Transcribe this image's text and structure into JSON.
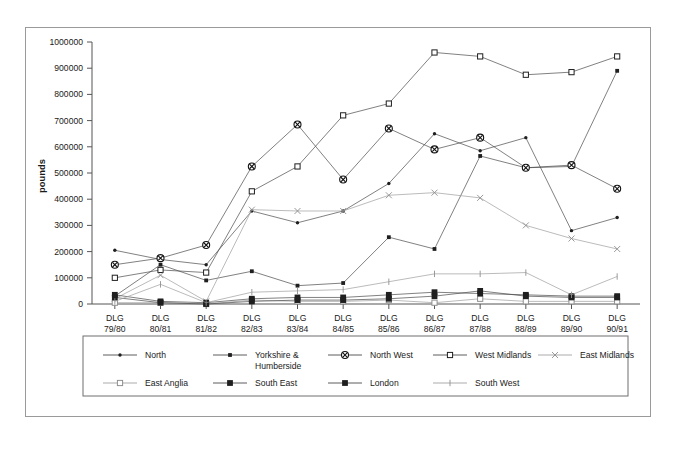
{
  "figure": {
    "y_axis_title": "pounds",
    "frame_color": "#9a9a9a",
    "ink_color": "#333333"
  },
  "chart_data": {
    "type": "line",
    "title": "",
    "subtitle": "",
    "xlabel": "",
    "ylabel": "pounds",
    "ylim": [
      0,
      1000000
    ],
    "ytick_step": 100000,
    "ytick_labels": [
      "0",
      "100000",
      "200000",
      "300000",
      "400000",
      "500000",
      "600000",
      "700000",
      "800000",
      "900000",
      "1000000"
    ],
    "grid": false,
    "legend_position": "bottom",
    "categories": [
      "DLG 79/80",
      "DLG 80/81",
      "DLG 81/82",
      "DLG 82/83",
      "DLG 83/84",
      "DLG 84/85",
      "DLG 85/86",
      "DLG 86/87",
      "DLG 87/88",
      "DLG 88/89",
      "DLG 89/90",
      "DLG 90/91"
    ],
    "category_lines": [
      [
        "DLG",
        "79/80"
      ],
      [
        "DLG",
        "80/81"
      ],
      [
        "DLG",
        "81/82"
      ],
      [
        "DLG",
        "82/83"
      ],
      [
        "DLG",
        "83/84"
      ],
      [
        "DLG",
        "84/85"
      ],
      [
        "DLG",
        "85/86"
      ],
      [
        "DLG",
        "86/87"
      ],
      [
        "DLG",
        "87/88"
      ],
      [
        "DLG",
        "88/89"
      ],
      [
        "DLG",
        "89/90"
      ],
      [
        "DLG",
        "90/91"
      ]
    ],
    "series": [
      {
        "name": "North",
        "marker": "dot",
        "tone": "dark",
        "values": [
          205000,
          170000,
          150000,
          355000,
          310000,
          355000,
          460000,
          650000,
          585000,
          635000,
          280000,
          330000
        ]
      },
      {
        "name": "Yorkshire & Humberside",
        "marker": "small-square",
        "tone": "dark",
        "values": [
          30000,
          150000,
          90000,
          125000,
          70000,
          80000,
          255000,
          210000,
          565000,
          520000,
          525000,
          890000
        ]
      },
      {
        "name": "North West",
        "marker": "circle-cross",
        "tone": "dark",
        "values": [
          150000,
          175000,
          225000,
          525000,
          685000,
          475000,
          670000,
          590000,
          635000,
          520000,
          530000,
          440000
        ]
      },
      {
        "name": "West Midlands",
        "marker": "open-square",
        "tone": "dark",
        "values": [
          100000,
          130000,
          120000,
          430000,
          525000,
          720000,
          765000,
          960000,
          945000,
          875000,
          885000,
          945000
        ]
      },
      {
        "name": "East Midlands",
        "marker": "cross",
        "tone": "light",
        "values": [
          20000,
          110000,
          10000,
          360000,
          355000,
          355000,
          415000,
          425000,
          405000,
          300000,
          250000,
          210000
        ]
      },
      {
        "name": "East Anglia",
        "marker": "open-square",
        "tone": "light",
        "values": [
          5000,
          5000,
          0,
          15000,
          10000,
          10000,
          15000,
          5000,
          20000,
          10000,
          10000,
          10000
        ]
      },
      {
        "name": "South East",
        "marker": "filled-square",
        "tone": "dark",
        "values": [
          35000,
          10000,
          5000,
          20000,
          25000,
          25000,
          35000,
          45000,
          40000,
          35000,
          30000,
          30000
        ]
      },
      {
        "name": "London",
        "marker": "filled-square",
        "tone": "dark",
        "values": [
          25000,
          5000,
          0,
          10000,
          15000,
          15000,
          20000,
          30000,
          50000,
          30000,
          25000,
          25000
        ]
      },
      {
        "name": "South West",
        "marker": "plus",
        "tone": "light",
        "values": [
          10000,
          75000,
          5000,
          45000,
          50000,
          55000,
          85000,
          115000,
          115000,
          120000,
          35000,
          105000
        ]
      }
    ]
  },
  "legend": {
    "rows": [
      [
        {
          "label": "North",
          "marker": "dot",
          "tone": "dark"
        },
        {
          "label": "Yorkshire & Humberside",
          "marker": "small-square",
          "tone": "dark"
        },
        {
          "label": "North West",
          "marker": "circle-cross",
          "tone": "dark"
        },
        {
          "label": "West Midlands",
          "marker": "open-square",
          "tone": "dark"
        },
        {
          "label": "East Midlands",
          "marker": "cross",
          "tone": "light"
        }
      ],
      [
        {
          "label": "East Anglia",
          "marker": "open-square",
          "tone": "light"
        },
        {
          "label": "South East",
          "marker": "filled-square",
          "tone": "dark"
        },
        {
          "label": "London",
          "marker": "filled-square",
          "tone": "dark"
        },
        {
          "label": "South West",
          "marker": "plus",
          "tone": "light"
        }
      ]
    ]
  }
}
